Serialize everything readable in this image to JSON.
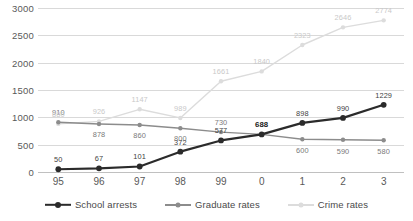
{
  "chart_data": {
    "type": "line",
    "title": "",
    "xlabel": "",
    "ylabel": "",
    "categories": [
      "95",
      "96",
      "97",
      "98",
      "99",
      "0",
      "1",
      "2",
      "3"
    ],
    "ylim": [
      0,
      3000
    ],
    "yticks": [
      "0",
      "500",
      "1000",
      "1500",
      "2000",
      "2500",
      "3000"
    ],
    "grid": true,
    "legend_position": "bottom",
    "series": [
      {
        "name": "School arrests",
        "color": "#2b2b2b",
        "values": [
          50,
          67,
          101,
          372,
          577,
          688,
          898,
          990,
          1229
        ],
        "labels": [
          "50",
          "67",
          "101",
          "372",
          "577",
          "688",
          "898",
          "990",
          "1229"
        ],
        "emphasized_index": 5
      },
      {
        "name": "Graduate rates",
        "color": "#8c8c8c",
        "values": [
          910,
          878,
          860,
          800,
          730,
          688,
          600,
          590,
          580
        ],
        "labels": [
          "910",
          "878",
          "860",
          "800",
          "730",
          "688",
          "600",
          "590",
          "580"
        ]
      },
      {
        "name": "Crime rates",
        "color": "#dcdcdc",
        "values": [
          880,
          926,
          1147,
          989,
          1661,
          1840,
          2323,
          2646,
          2774
        ],
        "labels": [
          "880",
          "926",
          "1147",
          "989",
          "1661",
          "1840",
          "2323",
          "2646",
          "2774"
        ]
      }
    ]
  },
  "legend": {
    "items": [
      {
        "label": "School arrests"
      },
      {
        "label": "Graduate rates"
      },
      {
        "label": "Crime rates"
      }
    ]
  }
}
